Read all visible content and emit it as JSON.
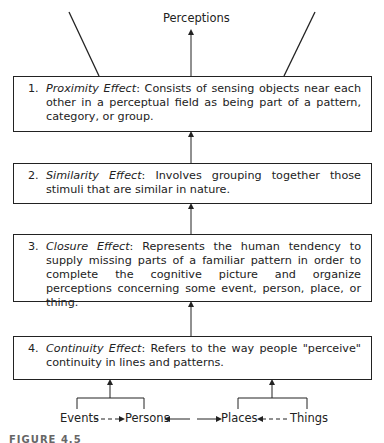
{
  "top_label": "Perceptions",
  "boxes": [
    {
      "num": "1.",
      "term": "Proximity Effect",
      "text": ": Consists of sensing objects near each other in a perceptual field as being part of a pattern, category, or group."
    },
    {
      "num": "2.",
      "term": "Similarity Effect",
      "text": ": Involves grouping together those stimuli that are similar in nature."
    },
    {
      "num": "3.",
      "term": "Closure Effect",
      "text": ": Represents the human tendency to supply missing parts of a familiar pattern in order to complete the cognitive picture and organize perceptions concerning some event, person, place, or thing."
    },
    {
      "num": "4.",
      "term": "Continuity Effect",
      "text": ": Refers to the way people \"perceive\" continuity in lines and patterns."
    }
  ],
  "inputs": {
    "events": "Events",
    "persons": "Persons",
    "places": "Places",
    "things": "Things"
  },
  "caption": "FIGURE 4.5"
}
